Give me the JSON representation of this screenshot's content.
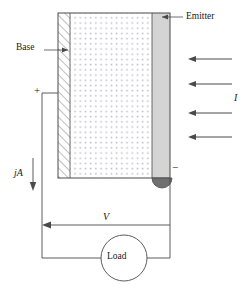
{
  "figure": {
    "type": "device-schematic-diagram",
    "labels": {
      "emitter": "Emitter",
      "base": "Base",
      "incident_flux": "I",
      "current_density": "jA",
      "voltage": "V",
      "load": "Load",
      "positive_terminal": "+",
      "negative_terminal": "−"
    },
    "colors": {
      "line": "#4a4a4a",
      "emitter_fill": "#d4d4d4",
      "bulk_fill": "#ffffff",
      "dot_color": "#b9b9c8",
      "hatch_color": "#8a8a8a",
      "contact_fill": "#6f6f6f",
      "text": "#1a1a1a",
      "background": "#ffffff"
    },
    "geometry": {
      "device": {
        "x": 58,
        "y": 13,
        "width": 112,
        "height": 165
      },
      "base_band": {
        "x": 58,
        "y": 13,
        "width": 12,
        "height": 165
      },
      "bulk_region": {
        "x": 70,
        "y": 13,
        "width": 82,
        "height": 165
      },
      "emitter_band": {
        "x": 152,
        "y": 13,
        "width": 18,
        "height": 165
      },
      "contact_semicircle": {
        "cx": 162,
        "cy": 178,
        "r": 10
      },
      "load_circle": {
        "cx": 124,
        "cy": 258,
        "r": 23
      }
    },
    "light_arrows": {
      "count": 4,
      "direction": "left",
      "x_start": 232,
      "x_end": 188,
      "y_positions": [
        59,
        84,
        113,
        137
      ]
    },
    "circuit": {
      "left_wire_x": 42,
      "right_wire_x": 170,
      "top_left_wire_y": 93,
      "bottom_wire_y": 258,
      "voltage_arrow_y": 225,
      "current_arrow": {
        "x": 33,
        "y_start": 160,
        "y_end": 190,
        "direction": "down"
      }
    }
  }
}
